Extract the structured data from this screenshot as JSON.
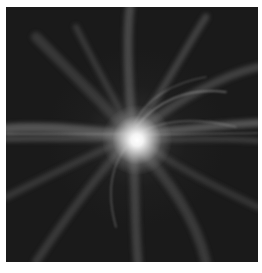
{
  "image": {
    "subject": "glowing bright core with swirling luminous filaments on dark background",
    "palette": {
      "background": "#1a1a1a",
      "filament": "#8a8a8a",
      "core": "#ffffff",
      "border": "#ffffff"
    }
  }
}
